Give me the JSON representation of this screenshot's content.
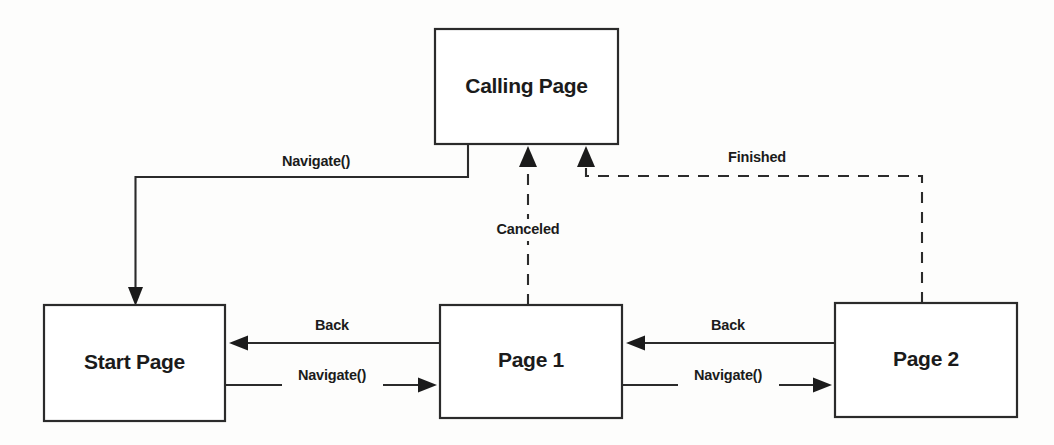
{
  "diagram": {
    "background_color": "#fdfdfc",
    "stroke_color": "#2b2b2b",
    "text_color": "#1b1b1b",
    "nodes": [
      {
        "id": "calling-page",
        "label": "Calling Page",
        "x": 435,
        "y": 29,
        "w": 183,
        "h": 115
      },
      {
        "id": "start-page",
        "label": "Start Page",
        "x": 44,
        "y": 305,
        "w": 181,
        "h": 116
      },
      {
        "id": "page-1",
        "label": "Page 1",
        "x": 440,
        "y": 305,
        "w": 182,
        "h": 113
      },
      {
        "id": "page-2",
        "label": "Page 2",
        "x": 835,
        "y": 303,
        "w": 182,
        "h": 114
      }
    ],
    "edges": [
      {
        "id": "calling-to-start",
        "label": "Navigate()",
        "style": "solid",
        "from": "calling-page",
        "to": "start-page",
        "label_x": 316,
        "label_y": 162
      },
      {
        "id": "page1-to-start",
        "label": "Back",
        "style": "solid",
        "from": "page-1",
        "to": "start-page",
        "label_x": 332,
        "label_y": 326
      },
      {
        "id": "start-to-page1",
        "label": "Navigate()",
        "style": "solid",
        "from": "start-page",
        "to": "page-1",
        "label_x": 332,
        "label_y": 376
      },
      {
        "id": "page2-to-page1",
        "label": "Back",
        "style": "solid",
        "from": "page-2",
        "to": "page-1",
        "label_x": 728,
        "label_y": 326
      },
      {
        "id": "page1-to-page2",
        "label": "Navigate()",
        "style": "solid",
        "from": "page-1",
        "to": "page-2",
        "label_x": 728,
        "label_y": 376
      },
      {
        "id": "page1-to-calling",
        "label": "Canceled",
        "style": "dashed",
        "from": "page-1",
        "to": "calling-page",
        "label_x": 528,
        "label_y": 230
      },
      {
        "id": "page2-to-calling",
        "label": "Finished",
        "style": "dashed",
        "from": "page-2",
        "to": "calling-page",
        "label_x": 757,
        "label_y": 158
      }
    ]
  }
}
